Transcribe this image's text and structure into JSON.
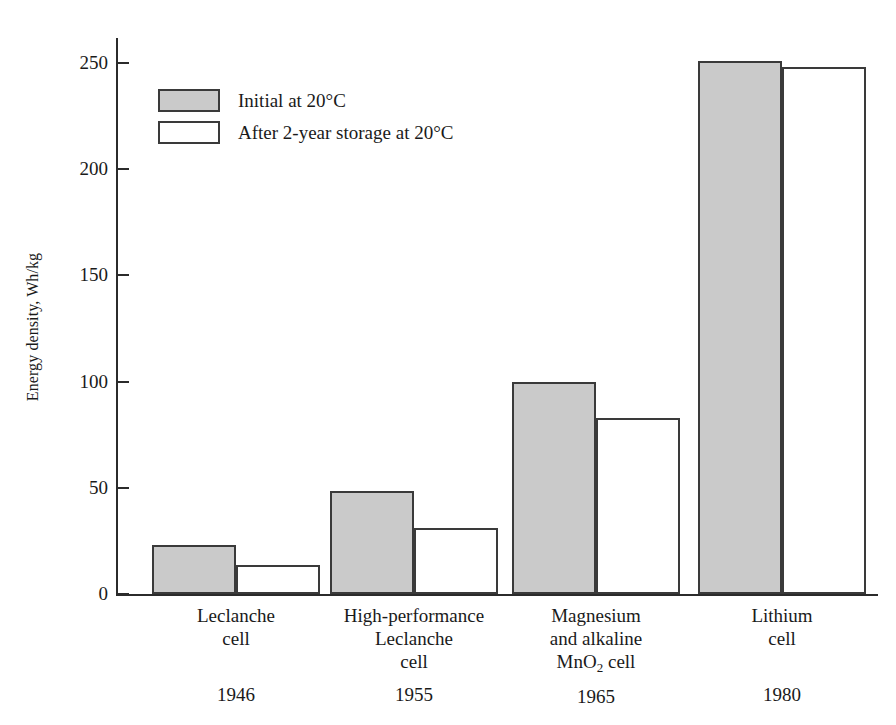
{
  "chart_data": {
    "type": "bar",
    "title": "",
    "xlabel": "",
    "ylabel": "Energy density, Wh/kg",
    "ylim": [
      0,
      265
    ],
    "yticks": [
      0,
      50,
      100,
      150,
      200,
      250
    ],
    "grid": false,
    "legend_position": "top-left",
    "categories": [
      "Leclanche\ncell",
      "High-performance\nLeclanche\ncell",
      "Magnesium\nand alkaline\nMnO2 cell",
      "Lithium\ncell"
    ],
    "category_years": [
      "1946",
      "1955",
      "1965",
      "1980"
    ],
    "series": [
      {
        "name": "Initial at 20°C",
        "values": [
          23,
          48.5,
          100,
          251
        ],
        "color": "#cacaca"
      },
      {
        "name": "After 2-year storage at 20°C",
        "values": [
          13.5,
          31,
          83,
          248
        ],
        "color": "#ffffff"
      }
    ]
  },
  "legend": {
    "entries": [
      {
        "label": "Initial at 20°C",
        "swatch": "initial"
      },
      {
        "label": "After 2-year storage at 20°C",
        "swatch": "aged"
      }
    ]
  },
  "axis": {
    "y_title": "Energy density, Wh/kg",
    "y_tick_labels": [
      "250",
      "200",
      "150",
      "100",
      "50",
      "0"
    ]
  },
  "categories": [
    {
      "line1": "Leclanche",
      "line2": "cell",
      "line3": "",
      "year": "1946",
      "has_subscript": false
    },
    {
      "line1": "High-performance",
      "line2": "Leclanche",
      "line3": "cell",
      "year": "1955",
      "has_subscript": false
    },
    {
      "line1": "Magnesium",
      "line2": "and alkaline",
      "line3": "MnO",
      "line3_sub": "2",
      "line3_tail": " cell",
      "year": "1965",
      "has_subscript": true
    },
    {
      "line1": "Lithium",
      "line2": "cell",
      "line3": "",
      "year": "1980",
      "has_subscript": false
    }
  ]
}
